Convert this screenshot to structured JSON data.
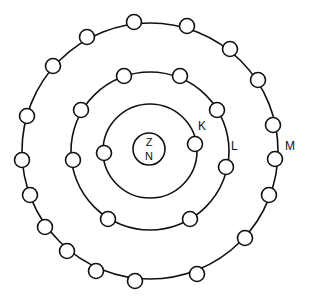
{
  "diagram": {
    "title": "",
    "type": "Bohr atomic model",
    "center": [
      150,
      151
    ],
    "nucleus": {
      "radius": 16,
      "labels": [
        "Z",
        "N"
      ]
    },
    "shells": [
      {
        "name": "K",
        "label": "K",
        "radius": 47,
        "electron_count": 2,
        "label_pos": [
          198,
          120
        ],
        "electrons": [
          [
            104,
            153
          ],
          [
            195,
            144
          ]
        ]
      },
      {
        "name": "L",
        "label": "L",
        "radius": 79,
        "electron_count": 8,
        "label_pos": [
          231,
          140
        ],
        "electrons": [
          [
            73,
            160
          ],
          [
            81,
            110
          ],
          [
            124,
            76
          ],
          [
            180,
            76
          ],
          [
            217,
            110
          ],
          [
            226,
            167
          ],
          [
            190,
            219
          ],
          [
            108,
            219
          ]
        ]
      },
      {
        "name": "M",
        "label": "M",
        "radius": 128,
        "electron_count": 18,
        "label_pos": [
          285,
          140
        ],
        "electrons": [
          [
            134,
            22
          ],
          [
            187,
            26
          ],
          [
            230,
            49
          ],
          [
            258,
            80
          ],
          [
            273,
            125
          ],
          [
            275,
            159
          ],
          [
            269,
            195
          ],
          [
            245,
            238
          ],
          [
            197,
            274
          ],
          [
            135,
            281
          ],
          [
            96,
            271
          ],
          [
            67,
            251
          ],
          [
            45,
            227
          ],
          [
            30,
            195
          ],
          [
            22,
            160
          ],
          [
            27,
            116
          ],
          [
            53,
            66
          ],
          [
            87,
            37
          ]
        ]
      }
    ]
  },
  "labels": {
    "nucleus_top": "Z",
    "nucleus_bottom": "N",
    "shell_k": "K",
    "shell_l": "L",
    "shell_m": "M"
  }
}
